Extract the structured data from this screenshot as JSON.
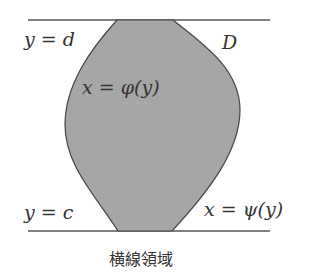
{
  "diagram": {
    "region_label": "D",
    "top_line_label": "y = d",
    "bottom_line_label": "y = c",
    "left_curve_label": "x = φ(y)",
    "right_curve_label": "x = ψ(y)",
    "caption": "横線領域",
    "fill_color": "#a6a6a6",
    "stroke_color": "#444444"
  }
}
